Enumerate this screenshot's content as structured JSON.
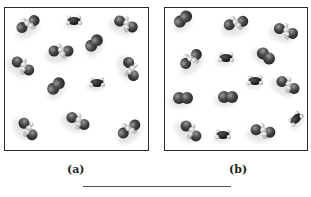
{
  "panels": [
    {
      "id": "a",
      "label": "(a)",
      "box": {
        "x": 4,
        "y": 7,
        "w": 145,
        "h": 144
      },
      "label_pos": {
        "x": 67,
        "y": 163
      },
      "molecules": [
        {
          "type": "pair-h",
          "x": 23,
          "y": 16,
          "angle": -30
        },
        {
          "type": "small-black",
          "x": 69,
          "y": 13,
          "angle": 0
        },
        {
          "type": "pair-h",
          "x": 121,
          "y": 16,
          "angle": 25
        },
        {
          "type": "pair",
          "x": 89,
          "y": 35,
          "angle": -45
        },
        {
          "type": "pair-h",
          "x": 56,
          "y": 43,
          "angle": 0
        },
        {
          "type": "pair-h",
          "x": 18,
          "y": 58,
          "angle": 35
        },
        {
          "type": "pair-h",
          "x": 126,
          "y": 61,
          "angle": 70
        },
        {
          "type": "pair",
          "x": 51,
          "y": 78,
          "angle": -45
        },
        {
          "type": "small-black",
          "x": 92,
          "y": 75,
          "angle": 0
        },
        {
          "type": "pair-h",
          "x": 23,
          "y": 121,
          "angle": 55
        },
        {
          "type": "pair-h",
          "x": 73,
          "y": 113,
          "angle": 30
        },
        {
          "type": "pair-h",
          "x": 124,
          "y": 121,
          "angle": -35
        }
      ]
    },
    {
      "id": "b",
      "label": "(b)",
      "box": {
        "x": 164,
        "y": 7,
        "w": 144,
        "h": 144
      },
      "label_pos": {
        "x": 229,
        "y": 163
      },
      "molecules": [
        {
          "type": "pair",
          "x": 18,
          "y": 11,
          "angle": -40
        },
        {
          "type": "pair-h",
          "x": 71,
          "y": 15,
          "angle": -15
        },
        {
          "type": "pair-h",
          "x": 121,
          "y": 23,
          "angle": 20
        },
        {
          "type": "pair-h",
          "x": 26,
          "y": 51,
          "angle": -40
        },
        {
          "type": "small-black",
          "x": 61,
          "y": 50,
          "angle": 0
        },
        {
          "type": "pair",
          "x": 101,
          "y": 48,
          "angle": 40
        },
        {
          "type": "small-black",
          "x": 90,
          "y": 73,
          "angle": 0
        },
        {
          "type": "pair-h",
          "x": 123,
          "y": 77,
          "angle": 30
        },
        {
          "type": "pair",
          "x": 18,
          "y": 90,
          "angle": 0
        },
        {
          "type": "pair",
          "x": 63,
          "y": 89,
          "angle": 0
        },
        {
          "type": "pair-h",
          "x": 26,
          "y": 123,
          "angle": 45
        },
        {
          "type": "small-black",
          "x": 58,
          "y": 127,
          "angle": 0
        },
        {
          "type": "pair-h",
          "x": 98,
          "y": 123,
          "angle": 10
        },
        {
          "type": "small-black",
          "x": 131,
          "y": 111,
          "angle": -45
        }
      ]
    }
  ],
  "answer_line": {
    "x": 83,
    "y": 186,
    "w": 148
  },
  "colors": {
    "atom_dark": "#4a4a4a",
    "atom_black": "#111111",
    "atom_h": "#d8d8d8",
    "border": "#2a2a2a"
  }
}
